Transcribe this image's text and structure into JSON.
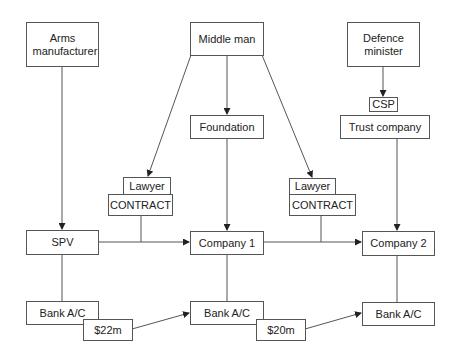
{
  "diagram": {
    "type": "flowchart",
    "nodes": {
      "arms_manufacturer": {
        "label": "Arms manufacturer"
      },
      "middle_man": {
        "label": "Middle man"
      },
      "defence_minister": {
        "label": "Defence minister"
      },
      "csp": {
        "label": "CSP"
      },
      "trust_company": {
        "label": "Trust company"
      },
      "foundation": {
        "label": "Foundation"
      },
      "lawyer_left": {
        "label": "Lawyer"
      },
      "contract_left": {
        "label": "CONTRACT"
      },
      "lawyer_right": {
        "label": "Lawyer"
      },
      "contract_right": {
        "label": "CONTRACT"
      },
      "spv": {
        "label": "SPV"
      },
      "company_1": {
        "label": "Company 1"
      },
      "company_2": {
        "label": "Company 2"
      },
      "bank_left": {
        "label": "Bank A/C"
      },
      "bank_mid": {
        "label": "Bank A/C"
      },
      "bank_right": {
        "label": "Bank A/C"
      },
      "payment_1": {
        "label": "$22m"
      },
      "payment_2": {
        "label": "$20m"
      }
    },
    "edges": [
      {
        "from": "arms_manufacturer",
        "to": "spv",
        "arrow": true
      },
      {
        "from": "middle_man",
        "to": "foundation",
        "arrow": true
      },
      {
        "from": "middle_man",
        "to": "lawyer_left",
        "arrow": true
      },
      {
        "from": "middle_man",
        "to": "lawyer_right",
        "arrow": true
      },
      {
        "from": "defence_minister",
        "to": "csp",
        "arrow": true
      },
      {
        "from": "foundation",
        "to": "company_1",
        "arrow": true
      },
      {
        "from": "trust_company",
        "to": "company_2",
        "arrow": true
      },
      {
        "from": "spv",
        "to": "company_1",
        "arrow": true,
        "via": "contract_left"
      },
      {
        "from": "company_1",
        "to": "company_2",
        "arrow": true,
        "via": "contract_right"
      },
      {
        "from": "spv",
        "to": "bank_left",
        "arrow": false
      },
      {
        "from": "company_1",
        "to": "bank_mid",
        "arrow": false
      },
      {
        "from": "company_2",
        "to": "bank_right",
        "arrow": false
      },
      {
        "from": "payment_1",
        "to": "bank_mid",
        "arrow": true
      },
      {
        "from": "payment_2",
        "to": "bank_right",
        "arrow": true
      }
    ]
  }
}
